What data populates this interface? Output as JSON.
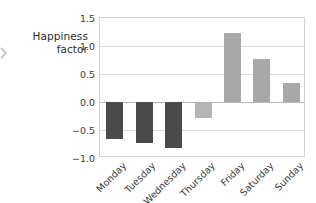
{
  "axis_annotation": {
    "line1": "Happiness",
    "line2": "factor",
    "chevron_icon": "chevron-right-icon"
  },
  "colors": {
    "negative_bar": "#4a4a4a",
    "positive_bar": "#a8a8a8",
    "thursday_bar": "#b4b4b4",
    "grid": "#dcdcdc",
    "axis": "#d2d2d2",
    "zero_line": "#b9b9b9",
    "text": "#3a3a3a",
    "background": "#ffffff"
  },
  "chart_data": {
    "type": "bar",
    "title": "",
    "xlabel": "",
    "ylabel": "Happiness factor",
    "categories": [
      "Monday",
      "Tuesday",
      "Wednesday",
      "Thursday",
      "Friday",
      "Saturday",
      "Sunday"
    ],
    "values": [
      -0.66,
      -0.73,
      -0.82,
      -0.29,
      1.23,
      0.77,
      0.34
    ],
    "bar_colors": [
      "#4a4a4a",
      "#4a4a4a",
      "#4a4a4a",
      "#b4b4b4",
      "#a8a8a8",
      "#a8a8a8",
      "#a8a8a8"
    ],
    "ylim": [
      -1.0,
      1.5
    ],
    "yticks": [
      1.5,
      1.0,
      0.5,
      0.0,
      -0.5,
      -1.0
    ],
    "ytick_labels": [
      "1.5",
      "1.0",
      "0.5",
      "0.0",
      "−0.5",
      "−1.0"
    ],
    "grid": true,
    "grid_axis": "y",
    "legend": false,
    "xtick_rotation": -45,
    "zero_line": 0.0
  }
}
